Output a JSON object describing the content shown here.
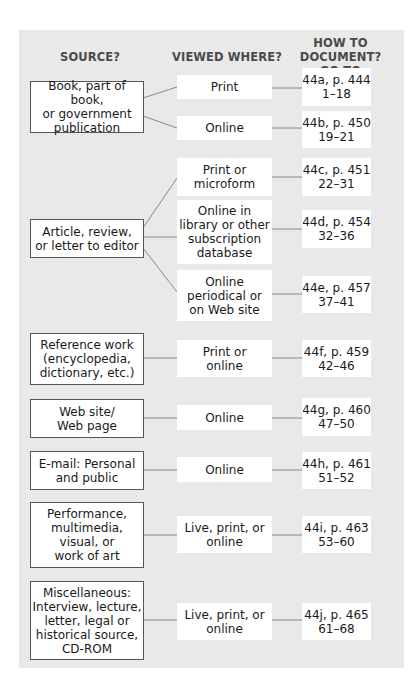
{
  "headers": {
    "source": "SOURCE?",
    "viewed": "VIEWED WHERE?",
    "document": "HOW TO DOCUMENT?\nGO TO"
  },
  "sources": [
    {
      "label": "Book, part of book,\nor government\npublication"
    },
    {
      "label": "Article, review,\nor letter to editor"
    },
    {
      "label": "Reference work\n(encyclopedia,\ndictionary, etc.)"
    },
    {
      "label": "Web site/\nWeb page"
    },
    {
      "label": "E-mail: Personal\nand public"
    },
    {
      "label": "Performance,\nmultimedia,\nvisual, or\nwork of art"
    },
    {
      "label": "Miscellaneous:\nInterview, lecture,\nletter, legal or\nhistorical source,\nCD-ROM"
    }
  ],
  "viewed": [
    {
      "label": "Print"
    },
    {
      "label": "Online"
    },
    {
      "label": "Print or\nmicroform"
    },
    {
      "label": "Online in\nlibrary or other\nsubscription\ndatabase"
    },
    {
      "label": "Online\nperiodical or\non Web site"
    },
    {
      "label": "Print or\nonline"
    },
    {
      "label": "Online"
    },
    {
      "label": "Online"
    },
    {
      "label": "Live, print, or\nonline"
    },
    {
      "label": "Live, print, or\nonline"
    }
  ],
  "refs": [
    {
      "label": "44a, p. 444\n1–18"
    },
    {
      "label": "44b, p. 450\n19–21"
    },
    {
      "label": "44c, p. 451\n22–31"
    },
    {
      "label": "44d, p. 454\n32–36"
    },
    {
      "label": "44e, p. 457\n37–41"
    },
    {
      "label": "44f, p. 459\n42–46"
    },
    {
      "label": "44g, p. 460\n47–50"
    },
    {
      "label": "44h, p. 461\n51–52"
    },
    {
      "label": "44i, p. 463\n53–60"
    },
    {
      "label": "44j, p. 465\n61–68"
    }
  ],
  "colors": {
    "panel": "#e9e9e9",
    "box_border": "#555555",
    "header_text": "#4a4a4a",
    "connector": "#8a8a8a"
  }
}
